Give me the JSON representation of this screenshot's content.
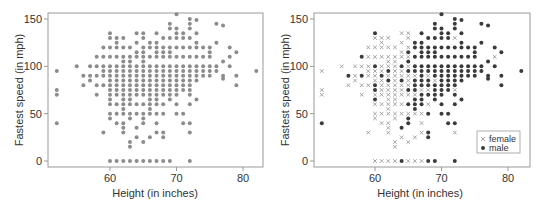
{
  "chart_data": [
    {
      "type": "scatter",
      "panel": "left",
      "title": "",
      "xlabel": "Height (in inches)",
      "ylabel": "Fastest speed (in mph)",
      "xticks": [
        60,
        70,
        80
      ],
      "yticks": [
        0,
        50,
        100,
        150
      ],
      "xlim": [
        51,
        84
      ],
      "ylim": [
        -4,
        156
      ],
      "grid": false,
      "legend": null,
      "marker_color": "#8c8c8c",
      "series": [
        {
          "name": "all",
          "marker": "dot",
          "source": "points (both sexes combined)"
        }
      ]
    },
    {
      "type": "scatter",
      "panel": "right",
      "title": "",
      "xlabel": "Height (in inches)",
      "ylabel": "Fastest speed (in mph)",
      "xticks": [
        60,
        70,
        80
      ],
      "yticks": [
        0,
        50,
        100,
        150
      ],
      "xlim": [
        51,
        84
      ],
      "ylim": [
        -4,
        156
      ],
      "grid": false,
      "legend": {
        "position": "lower right",
        "entries": [
          "female",
          "male"
        ]
      },
      "series": [
        {
          "name": "female",
          "marker": "x",
          "color": "#9a9a9a"
        },
        {
          "name": "male",
          "marker": "dot",
          "color": "#3a3a3a"
        }
      ]
    }
  ],
  "points": [
    [
      52,
      95,
      "f"
    ],
    [
      52,
      75,
      "f"
    ],
    [
      52,
      70,
      "f"
    ],
    [
      52,
      40,
      "m"
    ],
    [
      55,
      100,
      "f"
    ],
    [
      56,
      90,
      "m"
    ],
    [
      56,
      80,
      "f"
    ],
    [
      57,
      100,
      "f"
    ],
    [
      57,
      90,
      "f"
    ],
    [
      57,
      85,
      "f"
    ],
    [
      58,
      110,
      "m"
    ],
    [
      58,
      100,
      "f"
    ],
    [
      58,
      90,
      "m"
    ],
    [
      58,
      80,
      "f"
    ],
    [
      58,
      70,
      "f"
    ],
    [
      59,
      120,
      "f"
    ],
    [
      59,
      110,
      "f"
    ],
    [
      59,
      100,
      "f"
    ],
    [
      59,
      95,
      "f"
    ],
    [
      59,
      90,
      "f"
    ],
    [
      59,
      80,
      "f"
    ],
    [
      59,
      30,
      "f"
    ],
    [
      60,
      135,
      "m"
    ],
    [
      60,
      130,
      "f"
    ],
    [
      60,
      120,
      "f"
    ],
    [
      60,
      110,
      "f"
    ],
    [
      60,
      100,
      "m"
    ],
    [
      60,
      95,
      "f"
    ],
    [
      60,
      90,
      "f"
    ],
    [
      60,
      85,
      "f"
    ],
    [
      60,
      80,
      "m"
    ],
    [
      60,
      75,
      "m"
    ],
    [
      60,
      70,
      "f"
    ],
    [
      60,
      65,
      "m"
    ],
    [
      60,
      60,
      "f"
    ],
    [
      60,
      50,
      "f"
    ],
    [
      60,
      45,
      "f"
    ],
    [
      60,
      0,
      "f"
    ],
    [
      61,
      130,
      "f"
    ],
    [
      61,
      125,
      "f"
    ],
    [
      61,
      120,
      "f"
    ],
    [
      61,
      110,
      "f"
    ],
    [
      61,
      100,
      "f"
    ],
    [
      61,
      95,
      "f"
    ],
    [
      61,
      90,
      "m"
    ],
    [
      61,
      85,
      "f"
    ],
    [
      61,
      80,
      "f"
    ],
    [
      61,
      75,
      "f"
    ],
    [
      61,
      70,
      "f"
    ],
    [
      61,
      60,
      "f"
    ],
    [
      61,
      50,
      "f"
    ],
    [
      61,
      40,
      "f"
    ],
    [
      61,
      0,
      "f"
    ],
    [
      62,
      130,
      "f"
    ],
    [
      62,
      120,
      "f"
    ],
    [
      62,
      110,
      "f"
    ],
    [
      62,
      105,
      "f"
    ],
    [
      62,
      100,
      "f"
    ],
    [
      62,
      95,
      "m"
    ],
    [
      62,
      90,
      "f"
    ],
    [
      62,
      85,
      "m"
    ],
    [
      62,
      80,
      "f"
    ],
    [
      62,
      75,
      "f"
    ],
    [
      62,
      70,
      "f"
    ],
    [
      62,
      65,
      "f"
    ],
    [
      62,
      60,
      "f"
    ],
    [
      62,
      55,
      "f"
    ],
    [
      62,
      50,
      "f"
    ],
    [
      62,
      40,
      "f"
    ],
    [
      62,
      35,
      "f"
    ],
    [
      62,
      30,
      "f"
    ],
    [
      62,
      0,
      "f"
    ],
    [
      63,
      120,
      "f"
    ],
    [
      63,
      110,
      "f"
    ],
    [
      63,
      105,
      "f"
    ],
    [
      63,
      100,
      "f"
    ],
    [
      63,
      95,
      "f"
    ],
    [
      63,
      90,
      "f"
    ],
    [
      63,
      85,
      "f"
    ],
    [
      63,
      80,
      "f"
    ],
    [
      63,
      75,
      "f"
    ],
    [
      63,
      70,
      "f"
    ],
    [
      63,
      65,
      "f"
    ],
    [
      63,
      60,
      "f"
    ],
    [
      63,
      50,
      "f"
    ],
    [
      63,
      45,
      "f"
    ],
    [
      63,
      20,
      "f"
    ],
    [
      63,
      15,
      "f"
    ],
    [
      63,
      0,
      "f"
    ],
    [
      64,
      135,
      "f"
    ],
    [
      64,
      125,
      "f"
    ],
    [
      64,
      115,
      "f"
    ],
    [
      64,
      110,
      "f"
    ],
    [
      64,
      100,
      "m"
    ],
    [
      64,
      95,
      "f"
    ],
    [
      64,
      90,
      "f"
    ],
    [
      64,
      85,
      "m"
    ],
    [
      64,
      80,
      "f"
    ],
    [
      64,
      75,
      "f"
    ],
    [
      64,
      70,
      "f"
    ],
    [
      64,
      60,
      "f"
    ],
    [
      64,
      50,
      "f"
    ],
    [
      64,
      35,
      "m"
    ],
    [
      64,
      25,
      "f"
    ],
    [
      64,
      0,
      "m"
    ],
    [
      65,
      135,
      "f"
    ],
    [
      65,
      130,
      "f"
    ],
    [
      65,
      120,
      "f"
    ],
    [
      65,
      115,
      "m"
    ],
    [
      65,
      110,
      "f"
    ],
    [
      65,
      105,
      "m"
    ],
    [
      65,
      100,
      "f"
    ],
    [
      65,
      95,
      "m"
    ],
    [
      65,
      90,
      "f"
    ],
    [
      65,
      85,
      "f"
    ],
    [
      65,
      80,
      "f"
    ],
    [
      65,
      75,
      "m"
    ],
    [
      65,
      70,
      "f"
    ],
    [
      65,
      60,
      "m"
    ],
    [
      65,
      50,
      "f"
    ],
    [
      65,
      45,
      "m"
    ],
    [
      65,
      40,
      "m"
    ],
    [
      65,
      20,
      "f"
    ],
    [
      65,
      0,
      "f"
    ],
    [
      66,
      125,
      "m"
    ],
    [
      66,
      120,
      "m"
    ],
    [
      66,
      110,
      "m"
    ],
    [
      66,
      100,
      "m"
    ],
    [
      66,
      95,
      "m"
    ],
    [
      66,
      90,
      "f"
    ],
    [
      66,
      85,
      "m"
    ],
    [
      66,
      80,
      "m"
    ],
    [
      66,
      75,
      "m"
    ],
    [
      66,
      70,
      "f"
    ],
    [
      66,
      65,
      "m"
    ],
    [
      66,
      60,
      "m"
    ],
    [
      66,
      55,
      "m"
    ],
    [
      66,
      50,
      "f"
    ],
    [
      66,
      25,
      "f"
    ],
    [
      66,
      0,
      "f"
    ],
    [
      67,
      135,
      "m"
    ],
    [
      67,
      125,
      "m"
    ],
    [
      67,
      120,
      "m"
    ],
    [
      67,
      115,
      "m"
    ],
    [
      67,
      110,
      "m"
    ],
    [
      67,
      100,
      "m"
    ],
    [
      67,
      95,
      "m"
    ],
    [
      67,
      90,
      "m"
    ],
    [
      67,
      85,
      "m"
    ],
    [
      67,
      80,
      "m"
    ],
    [
      67,
      75,
      "f"
    ],
    [
      67,
      70,
      "m"
    ],
    [
      67,
      65,
      "m"
    ],
    [
      67,
      60,
      "m"
    ],
    [
      67,
      50,
      "f"
    ],
    [
      67,
      40,
      "f"
    ],
    [
      67,
      30,
      "f"
    ],
    [
      67,
      0,
      "f"
    ],
    [
      68,
      130,
      "m"
    ],
    [
      68,
      120,
      "m"
    ],
    [
      68,
      115,
      "m"
    ],
    [
      68,
      110,
      "m"
    ],
    [
      68,
      100,
      "m"
    ],
    [
      68,
      95,
      "m"
    ],
    [
      68,
      90,
      "f"
    ],
    [
      68,
      85,
      "m"
    ],
    [
      68,
      80,
      "m"
    ],
    [
      68,
      75,
      "f"
    ],
    [
      68,
      70,
      "m"
    ],
    [
      68,
      60,
      "f"
    ],
    [
      68,
      50,
      "m"
    ],
    [
      68,
      30,
      "m"
    ],
    [
      68,
      25,
      "m"
    ],
    [
      68,
      0,
      "m"
    ],
    [
      69,
      145,
      "m"
    ],
    [
      69,
      140,
      "m"
    ],
    [
      69,
      130,
      "m"
    ],
    [
      69,
      120,
      "m"
    ],
    [
      69,
      115,
      "m"
    ],
    [
      69,
      110,
      "m"
    ],
    [
      69,
      100,
      "m"
    ],
    [
      69,
      95,
      "m"
    ],
    [
      69,
      90,
      "m"
    ],
    [
      69,
      85,
      "f"
    ],
    [
      69,
      80,
      "m"
    ],
    [
      69,
      75,
      "m"
    ],
    [
      69,
      70,
      "m"
    ],
    [
      69,
      65,
      "m"
    ],
    [
      69,
      0,
      "m"
    ],
    [
      70,
      155,
      "m"
    ],
    [
      70,
      140,
      "m"
    ],
    [
      70,
      135,
      "m"
    ],
    [
      70,
      130,
      "m"
    ],
    [
      70,
      120,
      "m"
    ],
    [
      70,
      110,
      "m"
    ],
    [
      70,
      100,
      "m"
    ],
    [
      70,
      95,
      "m"
    ],
    [
      70,
      90,
      "m"
    ],
    [
      70,
      85,
      "m"
    ],
    [
      70,
      80,
      "m"
    ],
    [
      70,
      75,
      "m"
    ],
    [
      70,
      70,
      "m"
    ],
    [
      70,
      60,
      "m"
    ],
    [
      70,
      50,
      "m"
    ],
    [
      71,
      135,
      "m"
    ],
    [
      71,
      130,
      "m"
    ],
    [
      71,
      120,
      "m"
    ],
    [
      71,
      110,
      "m"
    ],
    [
      71,
      100,
      "m"
    ],
    [
      71,
      95,
      "m"
    ],
    [
      71,
      90,
      "m"
    ],
    [
      71,
      85,
      "m"
    ],
    [
      71,
      80,
      "m"
    ],
    [
      71,
      75,
      "m"
    ],
    [
      71,
      50,
      "m"
    ],
    [
      71,
      40,
      "m"
    ],
    [
      72,
      150,
      "m"
    ],
    [
      72,
      145,
      "m"
    ],
    [
      72,
      140,
      "m"
    ],
    [
      72,
      130,
      "f"
    ],
    [
      72,
      120,
      "m"
    ],
    [
      72,
      110,
      "m"
    ],
    [
      72,
      100,
      "m"
    ],
    [
      72,
      95,
      "m"
    ],
    [
      72,
      90,
      "m"
    ],
    [
      72,
      85,
      "m"
    ],
    [
      72,
      80,
      "m"
    ],
    [
      72,
      75,
      "f"
    ],
    [
      72,
      70,
      "m"
    ],
    [
      72,
      60,
      "m"
    ],
    [
      72,
      40,
      "m"
    ],
    [
      72,
      30,
      "f"
    ],
    [
      72,
      0,
      "m"
    ],
    [
      73,
      149,
      "m"
    ],
    [
      73,
      135,
      "m"
    ],
    [
      73,
      125,
      "m"
    ],
    [
      73,
      120,
      "m"
    ],
    [
      73,
      110,
      "m"
    ],
    [
      73,
      100,
      "m"
    ],
    [
      73,
      95,
      "m"
    ],
    [
      73,
      90,
      "m"
    ],
    [
      73,
      85,
      "m"
    ],
    [
      73,
      65,
      "m"
    ],
    [
      74,
      120,
      "m"
    ],
    [
      74,
      110,
      "m"
    ],
    [
      74,
      100,
      "m"
    ],
    [
      74,
      95,
      "m"
    ],
    [
      74,
      90,
      "m"
    ],
    [
      75,
      120,
      "m"
    ],
    [
      75,
      115,
      "m"
    ],
    [
      75,
      110,
      "m"
    ],
    [
      75,
      100,
      "m"
    ],
    [
      75,
      95,
      "m"
    ],
    [
      75,
      90,
      "m"
    ],
    [
      76,
      145,
      "m"
    ],
    [
      76,
      125,
      "m"
    ],
    [
      76,
      100,
      "m"
    ],
    [
      76,
      95,
      "m"
    ],
    [
      77,
      143,
      "m"
    ],
    [
      77,
      105,
      "m"
    ],
    [
      77,
      90,
      "m"
    ],
    [
      77,
      87,
      "m"
    ],
    [
      78,
      120,
      "m"
    ],
    [
      78,
      110,
      "f"
    ],
    [
      78,
      100,
      "m"
    ],
    [
      79,
      115,
      "m"
    ],
    [
      79,
      90,
      "m"
    ],
    [
      79,
      80,
      "m"
    ],
    [
      82,
      95,
      "m"
    ]
  ],
  "labels": {
    "xlabel": "Height (in inches)",
    "ylabel": "Fastest speed (in mph)",
    "legend_female": "female",
    "legend_male": "male"
  },
  "colors": {
    "axis": "#999999",
    "combined_marker": "#8c8c8c",
    "female_marker": "#9a9a9a",
    "male_marker": "#3a3a3a",
    "text": "#333333"
  }
}
